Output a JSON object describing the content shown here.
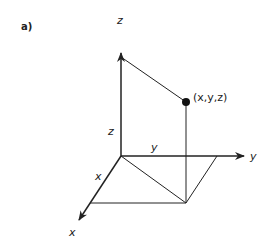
{
  "panel_label": "a)",
  "axes": {
    "x_label": "x",
    "y_label": "y",
    "z_label": "z"
  },
  "segments": {
    "x_label": "x",
    "y_label": "y",
    "z_label": "z"
  },
  "point": {
    "label": "(x,y,z)"
  },
  "colors": {
    "line": "#222222",
    "background": "#ffffff"
  }
}
